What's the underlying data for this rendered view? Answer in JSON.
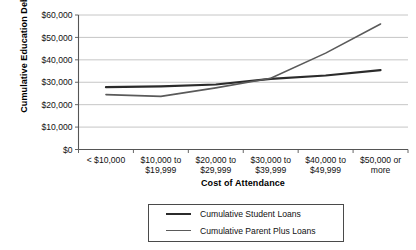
{
  "chart_data": {
    "type": "line",
    "title": "",
    "xlabel": "Cost of Attendance",
    "ylabel": "Cumulative Education Debt",
    "categories": [
      "< $10,000",
      "$10,000 to $19,999",
      "$20,000 to $29,999",
      "$30,000 to $39,999",
      "$40,000 to $49,999",
      "$50,000 or more"
    ],
    "category_lines": [
      [
        "< $10,000",
        ""
      ],
      [
        "$10,000 to",
        "$19,999"
      ],
      [
        "$20,000 to",
        "$29,999"
      ],
      [
        "$30,000 to",
        "$39,999"
      ],
      [
        "$40,000 to",
        "$49,999"
      ],
      [
        "$50,000 or",
        "more"
      ]
    ],
    "series": [
      {
        "name": "Cumulative Student Loans",
        "color": "#2b2b2b",
        "width": 2.2,
        "values": [
          27800,
          28200,
          29000,
          31500,
          33000,
          35400
        ]
      },
      {
        "name": "Cumulative Parent Plus Loans",
        "color": "#5a5a5a",
        "width": 1.6,
        "values": [
          24500,
          23700,
          27500,
          31800,
          43000,
          56000
        ]
      }
    ],
    "ylim": [
      0,
      60000
    ],
    "yticks": [
      0,
      10000,
      20000,
      30000,
      40000,
      50000,
      60000
    ],
    "ytick_labels": [
      "$0",
      "$10,000",
      "$20,000",
      "$30,000",
      "$40,000",
      "$50,000",
      "$60,000"
    ],
    "grid": "horizontal",
    "grid_color": "#b8b8b8",
    "axis_color": "#555555",
    "legend_position": "below",
    "legend": [
      "Cumulative Student Loans",
      "Cumulative Parent Plus Loans"
    ]
  }
}
